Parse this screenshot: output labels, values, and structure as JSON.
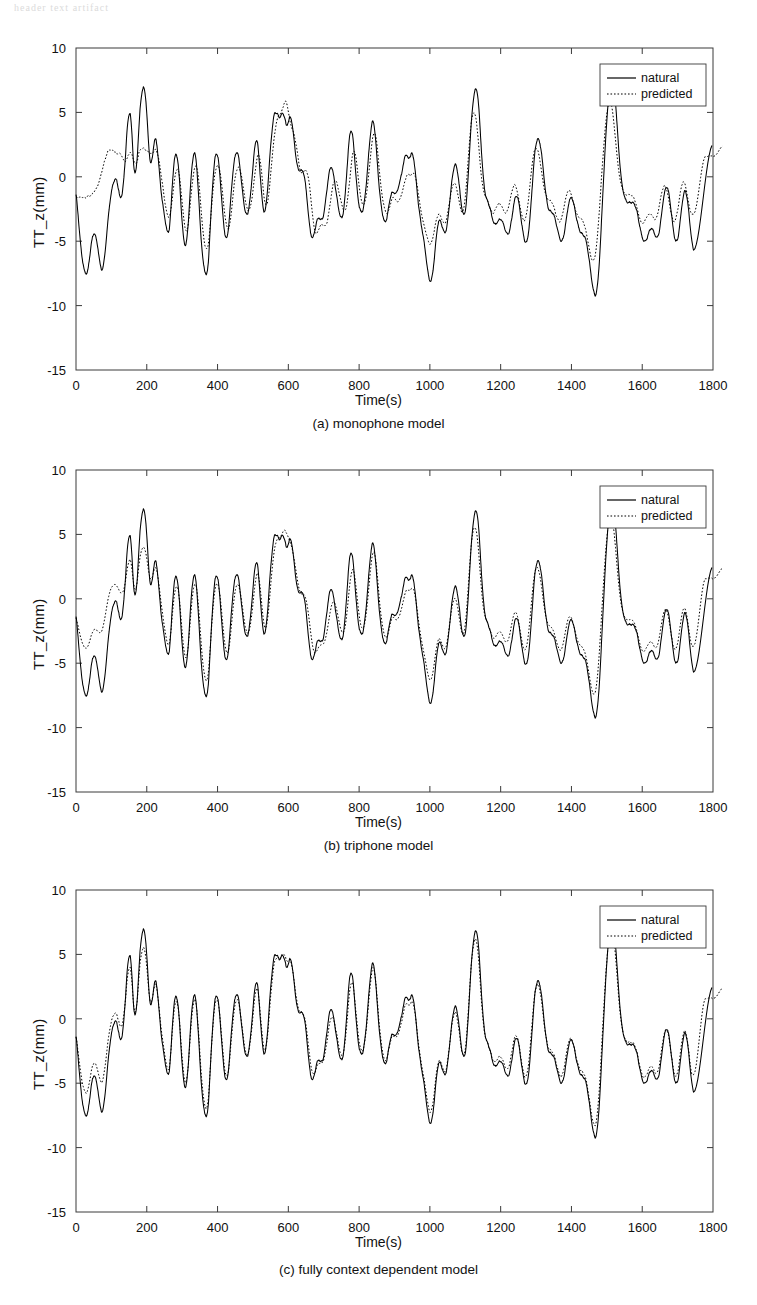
{
  "page": {
    "header_artifact": "header text artifact"
  },
  "figure": {
    "axis": {
      "xlabel": "Time(s)",
      "ylabel": "TT_z(mm)",
      "x_ticks": [
        0,
        200,
        400,
        600,
        800,
        1000,
        1200,
        1400,
        1600,
        1800
      ],
      "y_ticks": [
        10,
        5,
        0,
        -5,
        -10,
        -15
      ],
      "xlim": [
        0,
        1800
      ],
      "ylim": [
        -15,
        10
      ],
      "grid": false
    },
    "legend": {
      "position": "top-right",
      "entries": [
        {
          "label": "natural",
          "style": "solid",
          "color": "#000000"
        },
        {
          "label": "predicted",
          "style": "dotted",
          "color": "#000000"
        }
      ]
    },
    "panels": [
      {
        "id": "a",
        "caption": "(a)  monophone model",
        "deviation": 1.0
      },
      {
        "id": "b",
        "caption": "(b)  triphone model",
        "deviation": 0.62
      },
      {
        "id": "c",
        "caption": "(c) fully context dependent model",
        "deviation": 0.3
      }
    ]
  },
  "chart_data": {
    "type": "line",
    "title": "",
    "xlabel": "Time(s)",
    "ylabel": "TT_z(mm)",
    "xlim": [
      0,
      1800
    ],
    "ylim": [
      -15,
      10
    ],
    "x_ticks": [
      0,
      200,
      400,
      600,
      800,
      1000,
      1200,
      1400,
      1600,
      1800
    ],
    "y_ticks": [
      10,
      5,
      0,
      -5,
      -10,
      -15
    ],
    "grid": false,
    "legend": [
      "natural",
      "predicted"
    ],
    "x_start": 0,
    "x_end": 1745,
    "n_points": 350,
    "series": [
      {
        "name": "natural",
        "style": "solid",
        "values": [
          -1.4,
          -2.6,
          -4.2,
          -5.6,
          -6.6,
          -7.3,
          -7.5,
          -7.2,
          -6.3,
          -5.2,
          -4.6,
          -4.4,
          -4.9,
          -5.6,
          -6.6,
          -7.2,
          -7.0,
          -6.0,
          -4.6,
          -3.2,
          -2.0,
          -1.1,
          -0.5,
          -0.2,
          -0.3,
          -0.9,
          -1.6,
          -1.4,
          -0.4,
          1.3,
          3.4,
          4.6,
          4.9,
          3.2,
          1.0,
          0.3,
          1.4,
          3.6,
          5.6,
          6.6,
          6.9,
          6.2,
          4.3,
          2.2,
          1.1,
          1.5,
          2.6,
          2.9,
          2.1,
          0.6,
          -0.9,
          -2.0,
          -2.9,
          -3.7,
          -4.3,
          -4.0,
          -2.4,
          -0.2,
          1.3,
          1.7,
          1.2,
          -0.3,
          -2.4,
          -4.2,
          -5.2,
          -5.1,
          -3.9,
          -1.8,
          0.2,
          1.5,
          1.8,
          1.0,
          -0.9,
          -3.2,
          -5.2,
          -6.6,
          -7.3,
          -7.6,
          -6.6,
          -4.3,
          -1.8,
          0.2,
          1.5,
          1.8,
          1.2,
          -0.2,
          -2.0,
          -3.6,
          -4.6,
          -4.7,
          -3.8,
          -2.1,
          -0.4,
          0.9,
          1.7,
          1.9,
          1.4,
          0.3,
          -1.0,
          -2.1,
          -2.8,
          -2.9,
          -2.3,
          -1.2,
          0.3,
          1.8,
          2.8,
          2.6,
          1.2,
          -0.6,
          -2.1,
          -2.7,
          -2.2,
          -0.8,
          1.1,
          2.8,
          4.1,
          4.9,
          5.0,
          4.8,
          4.6,
          4.8,
          4.9,
          4.6,
          4.0,
          4.2,
          4.6,
          4.4,
          3.5,
          2.3,
          1.2,
          0.6,
          0.5,
          0.5,
          0.3,
          -0.3,
          -1.5,
          -2.9,
          -4.1,
          -4.7,
          -4.6,
          -4.0,
          -3.4,
          -3.2,
          -3.3,
          -3.3,
          -2.9,
          -2.0,
          -0.9,
          0.1,
          0.7,
          0.6,
          0.0,
          -0.9,
          -1.8,
          -2.6,
          -3.1,
          -3.1,
          -2.3,
          -0.8,
          1.1,
          2.8,
          3.6,
          3.2,
          1.9,
          0.1,
          -1.4,
          -2.3,
          -2.7,
          -2.6,
          -1.9,
          -0.7,
          0.9,
          2.5,
          3.8,
          4.3,
          3.7,
          2.2,
          0.4,
          -1.2,
          -2.3,
          -3.1,
          -3.5,
          -3.3,
          -2.6,
          -1.8,
          -1.3,
          -1.2,
          -1.3,
          -1.2,
          -0.8,
          -0.3,
          0.3,
          1.0,
          1.6,
          1.7,
          1.4,
          1.6,
          1.8,
          1.4,
          0.4,
          -1.0,
          -2.3,
          -3.3,
          -4.1,
          -4.9,
          -5.9,
          -7.0,
          -7.8,
          -8.1,
          -7.7,
          -6.6,
          -5.2,
          -4.0,
          -3.4,
          -3.5,
          -3.9,
          -4.3,
          -4.2,
          -3.5,
          -2.3,
          -1.0,
          0.1,
          0.8,
          0.9,
          0.3,
          -0.8,
          -2.0,
          -2.8,
          -2.9,
          -2.1,
          -0.3,
          2.0,
          4.2,
          5.7,
          6.6,
          6.8,
          6.0,
          4.2,
          2.0,
          0.1,
          -1.1,
          -1.7,
          -2.0,
          -2.4,
          -3.0,
          -3.5,
          -3.7,
          -3.6,
          -3.4,
          -3.3,
          -3.4,
          -3.7,
          -4.1,
          -4.4,
          -4.4,
          -3.9,
          -3.1,
          -2.2,
          -1.6,
          -1.5,
          -2.0,
          -2.9,
          -3.9,
          -4.7,
          -5.1,
          -4.9,
          -4.0,
          -2.5,
          -0.6,
          1.2,
          2.4,
          2.9,
          2.8,
          2.2,
          1.1,
          -0.2,
          -1.4,
          -2.2,
          -2.6,
          -2.7,
          -2.8,
          -3.1,
          -3.6,
          -4.2,
          -4.7,
          -5.0,
          -4.8,
          -4.2,
          -3.3,
          -2.4,
          -1.8,
          -1.6,
          -1.9,
          -2.5,
          -3.2,
          -3.8,
          -4.2,
          -4.4,
          -4.5,
          -4.7,
          -5.2,
          -6.0,
          -7.0,
          -8.0,
          -8.8,
          -9.2,
          -8.8,
          -7.5,
          -5.4,
          -2.8,
          -0.1,
          2.4,
          4.6,
          6.4,
          7.5,
          7.8,
          7.2,
          5.8,
          3.9,
          2.0,
          0.4,
          -0.7,
          -1.4,
          -1.8,
          -2.0,
          -2.0,
          -2.0,
          -2.0,
          -2.1,
          -2.4,
          -2.9,
          -3.6,
          -4.3,
          -4.8,
          -5.0,
          -4.9,
          -4.6,
          -4.2,
          -4.0,
          -4.1,
          -4.4,
          -4.7,
          -4.6,
          -4.1,
          -3.1,
          -2.0,
          -1.2,
          -0.8,
          -1.0,
          -1.8,
          -2.9,
          -4.0,
          -4.8,
          -5.0,
          -4.6,
          -3.6,
          -2.4,
          -1.5,
          -1.1,
          -1.5,
          -2.5,
          -3.8,
          -5.0,
          -5.7
        ]
      },
      {
        "name": "predicted",
        "style": "dotted",
        "values": [
          -1.6,
          -1.6,
          -1.6,
          -1.6,
          -1.6,
          -1.6,
          -1.6,
          -1.5,
          -1.5,
          -1.4,
          -1.3,
          -1.1,
          -0.9,
          -0.6,
          -0.2,
          0.3,
          0.8,
          1.3,
          1.7,
          2.0,
          2.1,
          2.1,
          2.0,
          1.9,
          1.8,
          1.8,
          1.8,
          1.6,
          1.3,
          1.2,
          1.4,
          1.7,
          1.9,
          1.7,
          1.3,
          1.0,
          1.2,
          1.8,
          2.1,
          2.2,
          2.2,
          2.1,
          2.0,
          1.9,
          1.8,
          1.8,
          2.0,
          2.1,
          1.8,
          1.2,
          0.3,
          -0.6,
          -1.6,
          -2.4,
          -3.0,
          -3.1,
          -2.5,
          -1.4,
          -0.3,
          0.4,
          0.6,
          0.0,
          -1.2,
          -2.6,
          -3.7,
          -4.2,
          -3.8,
          -2.6,
          -1.2,
          0.0,
          0.7,
          0.8,
          0.1,
          -1.3,
          -3.0,
          -4.4,
          -5.3,
          -5.6,
          -5.2,
          -3.9,
          -2.2,
          -0.7,
          0.3,
          0.8,
          0.8,
          0.3,
          -0.8,
          -2.1,
          -3.2,
          -3.9,
          -4.0,
          -3.4,
          -2.2,
          -0.9,
          0.1,
          0.6,
          0.7,
          0.4,
          -0.3,
          -1.2,
          -2.0,
          -2.5,
          -2.6,
          -2.2,
          -1.4,
          -0.3,
          0.8,
          1.6,
          1.6,
          0.8,
          -0.5,
          -1.7,
          -2.2,
          -1.9,
          -0.9,
          0.6,
          2.0,
          3.2,
          4.1,
          4.6,
          4.8,
          5.0,
          5.4,
          5.8,
          5.8,
          5.2,
          4.4,
          3.9,
          3.5,
          3.0,
          2.3,
          1.4,
          0.6,
          0.3,
          0.4,
          0.5,
          0.4,
          -0.1,
          -1.1,
          -2.4,
          -3.6,
          -4.3,
          -4.4,
          -4.1,
          -3.8,
          -3.7,
          -3.8,
          -3.8,
          -3.5,
          -2.8,
          -1.9,
          -1.0,
          -0.4,
          -0.3,
          -0.6,
          -1.2,
          -1.8,
          -2.3,
          -2.6,
          -2.5,
          -1.8,
          -0.7,
          0.6,
          1.7,
          2.0,
          1.5,
          0.4,
          -0.8,
          -1.7,
          -2.1,
          -2.1,
          -1.5,
          -0.5,
          0.8,
          2.1,
          3.1,
          3.4,
          2.9,
          1.7,
          0.2,
          -1.0,
          -1.9,
          -2.5,
          -2.8,
          -2.7,
          -2.3,
          -1.8,
          -1.6,
          -1.7,
          -1.9,
          -1.9,
          -1.7,
          -1.3,
          -0.8,
          -0.3,
          0.1,
          0.2,
          0.1,
          0.2,
          0.3,
          0.0,
          -0.6,
          -1.5,
          -2.4,
          -3.1,
          -3.7,
          -4.2,
          -4.7,
          -5.1,
          -5.2,
          -4.9,
          -4.3,
          -3.6,
          -3.1,
          -2.9,
          -3.1,
          -3.4,
          -3.6,
          -3.5,
          -2.9,
          -2.1,
          -1.3,
          -0.7,
          -0.5,
          -0.7,
          -1.3,
          -2.0,
          -2.6,
          -2.7,
          -2.1,
          -0.8,
          1.0,
          2.8,
          4.2,
          4.9,
          4.9,
          4.3,
          3.0,
          1.4,
          0.0,
          -0.9,
          -1.4,
          -1.7,
          -2.0,
          -2.4,
          -2.7,
          -2.8,
          -2.6,
          -2.3,
          -2.1,
          -2.1,
          -2.3,
          -2.6,
          -2.8,
          -2.7,
          -2.3,
          -1.7,
          -1.1,
          -0.7,
          -0.7,
          -1.1,
          -1.8,
          -2.5,
          -3.1,
          -3.4,
          -3.2,
          -2.5,
          -1.4,
          -0.1,
          1.1,
          1.9,
          2.2,
          2.1,
          1.6,
          0.8,
          -0.1,
          -0.9,
          -1.4,
          -1.7,
          -1.8,
          -1.9,
          -2.1,
          -2.5,
          -3.0,
          -3.3,
          -3.5,
          -3.3,
          -2.8,
          -2.1,
          -1.5,
          -1.1,
          -1.1,
          -1.4,
          -1.9,
          -2.4,
          -2.8,
          -3.1,
          -3.2,
          -3.3,
          -3.5,
          -3.9,
          -4.5,
          -5.2,
          -5.9,
          -6.4,
          -6.5,
          -6.1,
          -5.1,
          -3.5,
          -1.6,
          0.4,
          2.2,
          3.8,
          5.0,
          5.7,
          5.8,
          5.3,
          4.2,
          2.9,
          1.5,
          0.4,
          -0.4,
          -0.9,
          -1.2,
          -1.4,
          -1.4,
          -1.4,
          -1.4,
          -1.5,
          -1.7,
          -2.1,
          -2.6,
          -3.1,
          -3.5,
          -3.6,
          -3.5,
          -3.2,
          -3.0,
          -2.9,
          -2.9,
          -3.1,
          -3.3,
          -3.2,
          -2.8,
          -2.1,
          -1.4,
          -0.9,
          -0.7,
          -0.9,
          -1.5,
          -2.2,
          -2.9,
          -3.4,
          -3.4,
          -3.0,
          -2.3,
          -1.4,
          -0.7,
          -0.4,
          -0.6,
          -1.2,
          -2.0,
          -2.6,
          -2.9
        ]
      }
    ],
    "tail": {
      "note": "Final segment (approx t>1650) where natural rises to a plateau near 2.5 mm and predicted rises with a step near 1.6 then 2.4 mm.",
      "natural_plateau": 2.5,
      "predicted_step": [
        1.6,
        2.4
      ]
    }
  }
}
